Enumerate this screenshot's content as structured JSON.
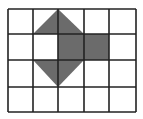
{
  "grid": {
    "columns": 5,
    "rows": 4,
    "x_lines": [
      8,
      33,
      58,
      84,
      109,
      136
    ],
    "y_lines": [
      9,
      34,
      60,
      87,
      112
    ],
    "line_color": "#222222",
    "background": "#ffffff"
  },
  "shapes": {
    "fill_color": "#6b6b6b",
    "top_triangle": {
      "points": "33,34 58,9 84,34"
    },
    "middle_rectangle": {
      "points": "58,34 109,34 109,60 58,60"
    },
    "bottom_triangle": {
      "points": "33,60 84,60 58,87"
    }
  }
}
